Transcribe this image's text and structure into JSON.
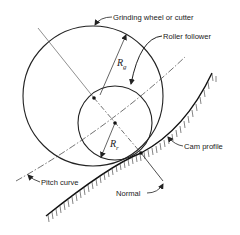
{
  "diagram": {
    "type": "cam-grinding-geometry",
    "labels": {
      "grinding_wheel": "Grinding wheel or cutter",
      "roller_follower": "Roller follower",
      "cam_profile": "Cam profile",
      "pitch_curve": "Pitch curve",
      "normal": "Normal"
    },
    "symbols": {
      "rg": {
        "main": "R",
        "sub": "g"
      },
      "rr": {
        "main": "R",
        "sub": "r"
      }
    },
    "colors": {
      "stroke": "#222222",
      "background": "#ffffff"
    }
  }
}
